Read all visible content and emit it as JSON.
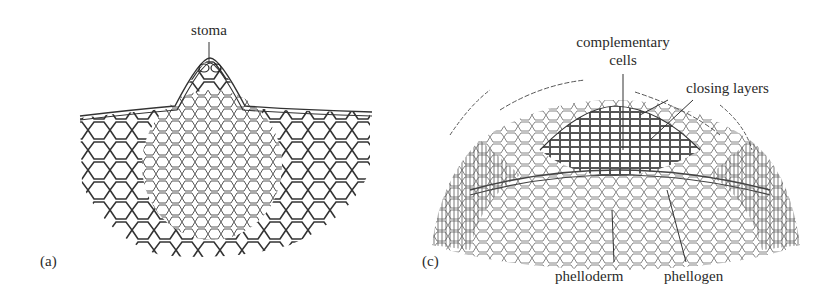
{
  "figure": {
    "panel_a": {
      "letter": "(a)",
      "labels": {
        "stoma": "stoma"
      }
    },
    "panel_c": {
      "letter": "(c)",
      "labels": {
        "complementary_cells_line1": "complementary",
        "complementary_cells_line2": "cells",
        "closing_layers": "closing layers",
        "phelloderm": "phelloderm",
        "phellogen": "phellogen"
      }
    },
    "colors": {
      "ink": "#2a2a2a",
      "background": "#ffffff"
    }
  }
}
